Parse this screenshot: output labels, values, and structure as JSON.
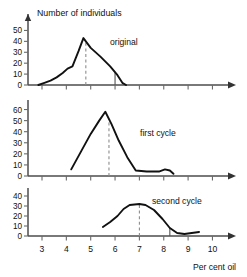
{
  "figure": {
    "y_axis_title": "Number of individuals",
    "x_axis_title": "Per cent oil",
    "x_tick_labels": [
      "3",
      "4",
      "5",
      "6",
      "7",
      "8",
      "9",
      "10"
    ]
  },
  "chart_data": {
    "type": "line",
    "title": "Number of individuals",
    "xlabel": "Per cent oil",
    "ylabel": "Number of individuals",
    "xlim": [
      2.3,
      10.6
    ],
    "xticks": [
      3,
      4,
      5,
      6,
      7,
      8,
      9,
      10
    ],
    "grid": false,
    "legend": "none",
    "panels": [
      {
        "name": "original",
        "annotation": "original",
        "ylabel": "Number of individuals",
        "ylim": [
          0,
          55
        ],
        "yticks": [
          0,
          10,
          20,
          30,
          40,
          50
        ],
        "ytick_labels": [
          "0",
          "10",
          "20",
          "30",
          "40",
          "50"
        ],
        "mean_marker_x": 4.8,
        "selection_marker_x": 6.0,
        "x": [
          2.85,
          3.1,
          3.35,
          3.6,
          3.85,
          4.05,
          4.25,
          4.5,
          4.7,
          5.0,
          5.4,
          5.8,
          6.1,
          6.3,
          6.45
        ],
        "y": [
          0,
          2,
          4,
          7,
          11,
          15,
          17,
          31,
          43,
          34,
          26,
          17,
          9,
          2,
          0
        ]
      },
      {
        "name": "first cycle",
        "annotation": "first cycle",
        "ylabel": "Number of individuals",
        "ylim": [
          0,
          65
        ],
        "yticks": [
          0,
          10,
          20,
          30,
          40,
          50,
          60
        ],
        "ytick_labels": [
          "0",
          "10",
          "20",
          "30",
          "40",
          "50",
          "60"
        ],
        "mean_marker_x": 5.75,
        "x": [
          4.2,
          4.6,
          5.0,
          5.35,
          5.6,
          5.85,
          6.15,
          6.5,
          6.85,
          7.3,
          7.8,
          8.05,
          8.25,
          8.4
        ],
        "y": [
          6,
          22,
          38,
          50,
          58,
          47,
          32,
          17,
          5,
          4,
          4,
          6,
          5,
          2
        ]
      },
      {
        "name": "second cycle",
        "annotation": "second cycle",
        "ylabel": "Number of individuals",
        "ylim": [
          0,
          44
        ],
        "yticks": [
          0,
          10,
          20,
          30,
          40
        ],
        "ytick_labels": [
          "0",
          "10",
          "20",
          "30",
          "40"
        ],
        "mean_marker_x": 7.0,
        "selection_marker_x": 8.25,
        "x": [
          5.5,
          5.8,
          6.1,
          6.35,
          6.6,
          7.0,
          7.25,
          7.6,
          7.95,
          8.25,
          8.55,
          8.85,
          9.15,
          9.45
        ],
        "y": [
          9,
          14,
          20,
          27,
          31,
          32,
          31,
          26,
          17,
          8,
          3,
          2,
          3,
          4
        ]
      }
    ]
  }
}
